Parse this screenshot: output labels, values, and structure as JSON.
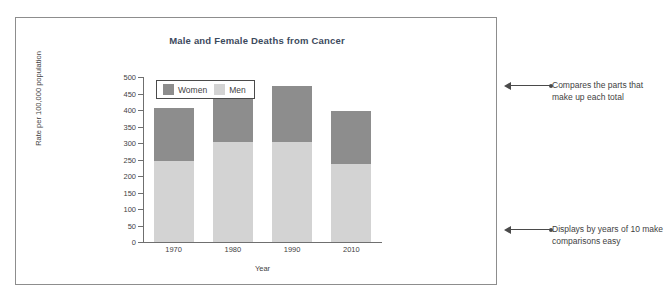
{
  "figure": {
    "title": "Male and Female Deaths from Cancer",
    "x_axis_title": "Year",
    "y_axis_title": "Rate per 100,000 population",
    "title_color": "#3c4a5d",
    "frame_border_color": "#8d8d8d"
  },
  "legend": {
    "position": "top-left-inside",
    "entries": [
      {
        "label": "Women",
        "color": "#8d8d8d",
        "icon": "legend-swatch-icon"
      },
      {
        "label": "Men",
        "color": "#d3d3d3",
        "icon": "legend-swatch-icon"
      }
    ]
  },
  "y_ticks": [
    "500",
    "450",
    "400",
    "350",
    "300",
    "250",
    "200",
    "150",
    "100",
    "50",
    "0"
  ],
  "annotations": [
    {
      "id": "annotation-top",
      "text": "Compares the parts that make up each total",
      "arrow": "left-arrow-icon"
    },
    {
      "id": "annotation-bottom",
      "text": "Displays by years of 10 make comparisons easy",
      "arrow": "left-arrow-icon"
    }
  ],
  "chart_data": {
    "type": "bar",
    "subtype": "stacked-vertical",
    "title": "Male and Female Deaths from Cancer",
    "xlabel": "Year",
    "ylabel": "Rate per 100,000 population",
    "categories": [
      "1970",
      "1980",
      "1990",
      "2010"
    ],
    "ylim": [
      0,
      500
    ],
    "ytick_step": 50,
    "grid": false,
    "legend_position": "upper left",
    "stack_order_bottom_to_top": [
      "Men",
      "Women"
    ],
    "series": [
      {
        "name": "Men",
        "color": "#d3d3d3",
        "values": [
          245,
          303,
          303,
          237
        ]
      },
      {
        "name": "Women",
        "color": "#8d8d8d",
        "values": [
          160,
          150,
          169,
          161
        ]
      }
    ],
    "totals": [
      405,
      453,
      472,
      398
    ]
  }
}
